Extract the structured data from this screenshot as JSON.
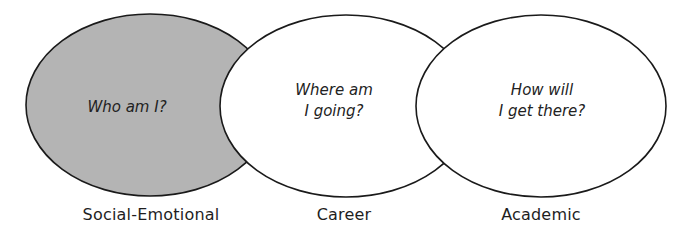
{
  "diagram": {
    "type": "venn",
    "colors": {
      "stroke": "#1a1a1a",
      "highlight_fill": "#b4b4b4",
      "default_fill": "#ffffff"
    },
    "circles": [
      {
        "id": "social-emotional",
        "label": "Social-Emotional",
        "question_lines": [
          "Who am I?"
        ],
        "highlighted": true
      },
      {
        "id": "career",
        "label": "Career",
        "question_lines": [
          "Where am",
          "I going?"
        ],
        "highlighted": false
      },
      {
        "id": "academic",
        "label": "Academic",
        "question_lines": [
          "How will",
          "I get there?"
        ],
        "highlighted": false
      }
    ]
  }
}
